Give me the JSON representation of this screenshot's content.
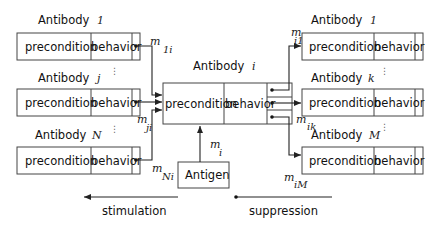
{
  "diagram": {
    "cell_labels": {
      "precondition": "precondition",
      "behavior": "behavior"
    },
    "antibody_word": "Antibody",
    "left_antibodies": [
      {
        "index": "1",
        "edge_label": "m",
        "edge_sub": "1i"
      },
      {
        "index": "j",
        "edge_label": "m",
        "edge_sub": "ji"
      },
      {
        "index": "N",
        "edge_label": "m",
        "edge_sub": "Ni"
      }
    ],
    "center_antibody": {
      "index": "i"
    },
    "right_antibodies": [
      {
        "index": "1",
        "edge_label": "m",
        "edge_sub": "i1"
      },
      {
        "index": "k",
        "edge_label": "m",
        "edge_sub": "ik"
      },
      {
        "index": "M",
        "edge_label": "m",
        "edge_sub": "iM"
      }
    ],
    "antigen": {
      "label": "Antigen",
      "edge_label": "m",
      "edge_sub": "i"
    },
    "legend": {
      "stimulation": "stimulation",
      "suppression": "suppression"
    },
    "ellipsis": "⋮"
  }
}
